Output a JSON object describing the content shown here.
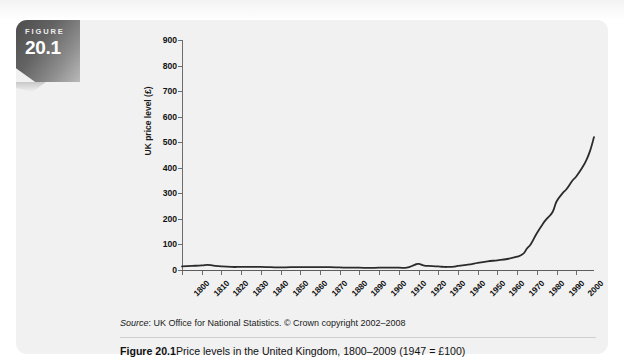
{
  "badge": {
    "word": "FIGURE",
    "number": "20.1"
  },
  "source": {
    "label": "Source",
    "text": ": UK Office for National Statistics. © Crown copyright 2002–2008"
  },
  "caption": {
    "label": "Figure 20.1",
    "text": "Price levels in the United Kingdom, 1800–2009 (1947 = £100)"
  },
  "colors": {
    "panel_background": "#f1f1f1",
    "series_line": "#2b2b2b",
    "axis": "#6d6d6d",
    "badge_dark": "#4d4d4d",
    "badge_light": "#b9b9b9"
  },
  "chart_data": {
    "type": "line",
    "title": "Price levels in the United Kingdom, 1800–2009 (1947 = £100)",
    "xlabel": "",
    "ylabel": "UK price level (£)",
    "xlim": [
      1800,
      2009
    ],
    "ylim": [
      0,
      900
    ],
    "grid": false,
    "legend": null,
    "y_ticks": [
      0,
      100,
      200,
      300,
      400,
      500,
      600,
      700,
      800,
      900
    ],
    "x_ticks": [
      1800,
      1810,
      1820,
      1830,
      1840,
      1850,
      1860,
      1870,
      1880,
      1890,
      1900,
      1910,
      1920,
      1930,
      1940,
      1950,
      1960,
      1970,
      1980,
      1990,
      2000
    ],
    "series": [
      {
        "name": "UK price level",
        "x": [
          1800,
          1805,
          1810,
          1813,
          1816,
          1820,
          1825,
          1830,
          1835,
          1840,
          1845,
          1850,
          1855,
          1860,
          1865,
          1870,
          1875,
          1880,
          1885,
          1890,
          1895,
          1900,
          1905,
          1910,
          1914,
          1918,
          1920,
          1923,
          1925,
          1930,
          1933,
          1935,
          1938,
          1940,
          1945,
          1947,
          1950,
          1955,
          1960,
          1965,
          1970,
          1973,
          1975,
          1977,
          1980,
          1983,
          1985,
          1988,
          1990,
          1993,
          1995,
          1998,
          2000,
          2003,
          2005,
          2007,
          2009
        ],
        "y": [
          14,
          16,
          18,
          20,
          17,
          14,
          12,
          12,
          12,
          12,
          11,
          10,
          11,
          11,
          11,
          11,
          11,
          10,
          9,
          9,
          8,
          9,
          9,
          9,
          9,
          20,
          24,
          17,
          16,
          14,
          12,
          12,
          13,
          16,
          21,
          23,
          28,
          34,
          38,
          43,
          52,
          63,
          84,
          102,
          144,
          180,
          200,
          227,
          268,
          300,
          316,
          349,
          366,
          400,
          428,
          466,
          520
        ]
      }
    ],
    "annotations": []
  }
}
